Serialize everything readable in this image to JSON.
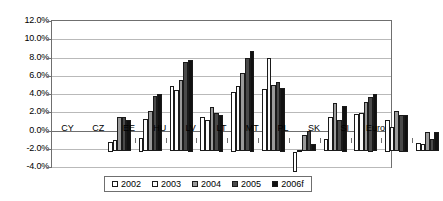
{
  "chart_data": {
    "type": "bar",
    "title": "",
    "xlabel": "",
    "ylabel": "",
    "ylim": [
      -4.0,
      12.0
    ],
    "ytick_step": 2.0,
    "ytick_labels": [
      "12.0%",
      "10.0%",
      "8.0%",
      "6.0%",
      "4.0%",
      "2.0%",
      "0.0%",
      "-2.0%",
      "-4.0%"
    ],
    "ytick_values": [
      12.0,
      10.0,
      8.0,
      6.0,
      4.0,
      2.0,
      0.0,
      -2.0,
      -4.0
    ],
    "grid": true,
    "legend_position": "bottom",
    "categories": [
      "CY",
      "CZ",
      "EE",
      "HU",
      "LV",
      "LT",
      "MT",
      "PL",
      "SK",
      "SI",
      "Euro"
    ],
    "series": [
      {
        "name": "2002",
        "color": "#ffffff",
        "values": [
          1.0,
          1.5,
          7.2,
          3.8,
          6.5,
          6.8,
          -2.3,
          1.4,
          4.1,
          3.5,
          0.9
        ]
      },
      {
        "name": "2003",
        "color": "#fafafa",
        "values": [
          1.3,
          3.6,
          6.7,
          3.4,
          7.2,
          10.3,
          0.2,
          3.8,
          4.2,
          2.7,
          0.8
        ]
      },
      {
        "name": "2004",
        "color": "#9a9a9a",
        "values": [
          3.8,
          4.4,
          7.8,
          4.9,
          8.6,
          7.3,
          1.8,
          5.3,
          5.4,
          4.4,
          2.1
        ]
      },
      {
        "name": "2005",
        "color": "#4a4a4a",
        "values": [
          3.8,
          6.1,
          9.8,
          4.2,
          10.2,
          7.6,
          2.2,
          3.4,
          6.0,
          4.0,
          1.4
        ]
      },
      {
        "name": "2006f",
        "color": "#111111",
        "values": [
          3.4,
          6.3,
          10.0,
          4.0,
          11.0,
          7.0,
          0.8,
          5.0,
          6.3,
          4.0,
          2.1
        ]
      }
    ]
  }
}
